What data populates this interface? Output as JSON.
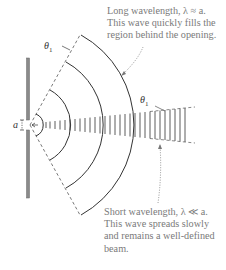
{
  "diagram": {
    "labels": {
      "theta": "θ",
      "theta_sub": "1",
      "slit_width": "a"
    },
    "captions": {
      "long_wavelength": {
        "line1": "Long wavelength, λ ≈ a.",
        "line2": "This wave quickly fills the",
        "line3": "region behind the opening."
      },
      "short_wavelength": {
        "line1": "Short wavelength, λ ≪ a.",
        "line2": "This wave spreads slowly",
        "line3": "and remains a well-defined",
        "line4": "beam."
      }
    },
    "colors": {
      "barrier": "#8a8a8a",
      "wavefront": "#333333",
      "caption": "#7a7a7a",
      "dashed": "#555555"
    },
    "icons": {
      "barrier": "slit-barrier",
      "long_wavefronts": "circular-wavefronts",
      "short_wavefronts": "plane-wave-beam"
    }
  }
}
